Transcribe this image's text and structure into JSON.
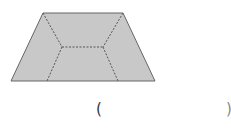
{
  "figure": {
    "shape": "trapezoid",
    "fill": "#c8c8c8",
    "stroke": "#666666",
    "dash_stroke": "#555555",
    "outline_points": "43,13 123,13 155,81 11,81",
    "dashed_lines": [
      {
        "x1": 43,
        "y1": 13,
        "x2": 62,
        "y2": 47
      },
      {
        "x1": 123,
        "y1": 13,
        "x2": 103,
        "y2": 47
      },
      {
        "x1": 62,
        "y1": 47,
        "x2": 103,
        "y2": 47
      },
      {
        "x1": 62,
        "y1": 47,
        "x2": 47,
        "y2": 81
      },
      {
        "x1": 103,
        "y1": 47,
        "x2": 118,
        "y2": 81
      }
    ]
  },
  "answer": {
    "open_paren": "(",
    "close_paren": ")"
  }
}
